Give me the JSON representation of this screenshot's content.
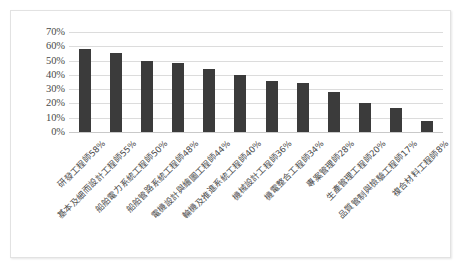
{
  "chart_data": {
    "type": "bar",
    "title": "",
    "subtitle": "",
    "xlabel": "",
    "ylabel": "",
    "ylim": [
      0,
      0.7
    ],
    "ytick_labels": [
      "70%",
      "60%",
      "50%",
      "40%",
      "30%",
      "20%",
      "10%",
      "0%"
    ],
    "ytick_values": [
      70,
      60,
      50,
      40,
      30,
      20,
      10,
      0
    ],
    "grid": true,
    "legend": "none",
    "categories": [
      "研發工程師58%",
      "基本及細而設計工程師55%",
      "船舶電力系統工程師50%",
      "船舶管路系統工程師48%",
      "電機設計與繪圖工程師44%",
      "輪機及推進系統工程師40%",
      "機械設計工程師36%",
      "機電整合工程師34%",
      "專案管理師28%",
      "生產管理工程師20%",
      "品質管制與檢驗工程師17%",
      "複合材料工程師8%"
    ],
    "values": [
      58,
      55,
      50,
      48,
      44,
      40,
      36,
      34,
      28,
      20,
      17,
      8
    ],
    "bar_color": "#3b3b3b",
    "gridline_color": "#dcdcdc",
    "axis_text_color": "#4a4a4a",
    "background_color": "#ffffff",
    "border_color": "#e2e2e2"
  }
}
